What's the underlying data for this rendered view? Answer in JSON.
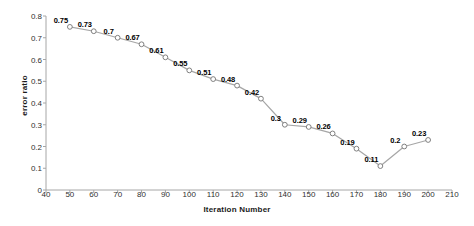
{
  "chart_data": {
    "type": "line",
    "title": "",
    "xlabel": "Iteration Number",
    "ylabel": "error ratio",
    "x": [
      50,
      60,
      70,
      80,
      90,
      100,
      110,
      120,
      130,
      140,
      150,
      160,
      170,
      180,
      190,
      200
    ],
    "values": [
      0.75,
      0.73,
      0.7,
      0.67,
      0.61,
      0.55,
      0.51,
      0.48,
      0.42,
      0.3,
      0.29,
      0.26,
      0.19,
      0.11,
      0.2,
      0.23
    ],
    "point_labels": [
      "0.75",
      "0.73",
      "0.7",
      "0.67",
      "0.61",
      "0.55",
      "0.51",
      "0.48",
      "0.42",
      "0.3",
      "0.29",
      "0.26",
      "0.19",
      "0.11",
      "0.2",
      "0.23"
    ],
    "xlim": [
      40,
      210
    ],
    "ylim": [
      0,
      0.8
    ],
    "xticks": [
      40,
      50,
      60,
      70,
      80,
      90,
      100,
      110,
      120,
      130,
      140,
      150,
      160,
      170,
      180,
      190,
      200,
      210
    ],
    "xtick_labels": [
      "40",
      "50",
      "60",
      "70",
      "80",
      "90",
      "100",
      "110",
      "120",
      "130",
      "140",
      "150",
      "160",
      "170",
      "180",
      "190",
      "200",
      "210"
    ],
    "yticks": [
      0,
      0.1,
      0.2,
      0.3,
      0.4,
      0.5,
      0.6,
      0.7,
      0.8
    ],
    "ytick_labels": [
      "0",
      "0.1",
      "0.2",
      "0.3",
      "0.4",
      "0.5",
      "0.6",
      "0.7",
      "0.8"
    ],
    "grid": false,
    "legend": false,
    "series_color": "#a6a6a6",
    "marker_face_color": "#ffffff",
    "marker_edge_color": "#808080",
    "axis_color": "#a6a6a6",
    "label_color": "#000000"
  }
}
